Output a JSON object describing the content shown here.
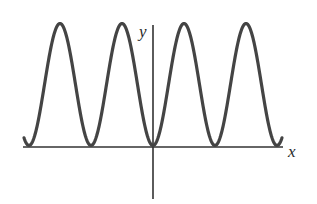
{
  "chart_data": {
    "type": "line",
    "title": "",
    "xlabel": "x",
    "ylabel": "y",
    "function": "y = 1 - cos(x)",
    "x_range": [
      -4.75,
      4.75
    ],
    "units_per_period": 1,
    "periods_left_of_origin": 2,
    "periods_right_of_origin": 2,
    "minima_x": [
      -2,
      -1,
      0,
      1,
      2
    ],
    "maxima_x": [
      -1.5,
      -0.5,
      0.5,
      1.5
    ],
    "y_min": 0,
    "y_max": 2,
    "x_tick_labels": [],
    "y_tick_labels": [],
    "grid": false,
    "legend": null,
    "colors": {
      "curve": "#444444",
      "axes": "#333333",
      "background": "#ffffff"
    }
  },
  "labels": {
    "x_axis": "x",
    "y_axis": "y"
  },
  "layout": {
    "origin_px": [
      153,
      147
    ],
    "period_px": 62,
    "amplitude_px": 61,
    "curve_top_px": 24,
    "x_axis_start_px": 23,
    "x_axis_end_px": 283,
    "y_axis_top_px": 25,
    "y_axis_bottom_px": 199,
    "curve_x_start_px": 24,
    "curve_x_end_px": 282
  }
}
